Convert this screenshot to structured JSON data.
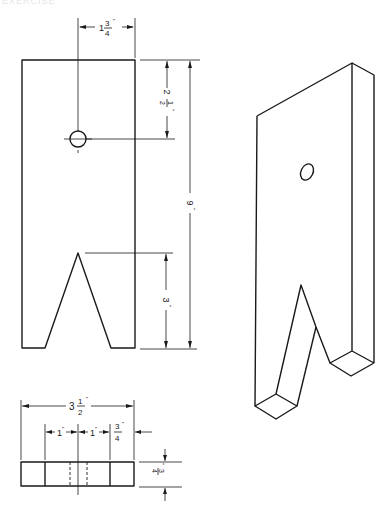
{
  "figure": {
    "header_text": "EXERCISE",
    "views": {
      "front": {
        "label": "front-view",
        "dimensions": {
          "hole_from_top": {
            "whole": "2",
            "num": "1",
            "den": "2",
            "unit": "\""
          },
          "width_to_hole_center": {
            "whole": "1",
            "num": "3",
            "den": "4",
            "unit": "\""
          },
          "overall_height": {
            "text": "9",
            "unit": "\""
          },
          "notch_depth": {
            "text": "3",
            "unit": "\""
          }
        }
      },
      "top": {
        "label": "top-view",
        "dimensions": {
          "overall_width": {
            "whole": "3",
            "num": "1",
            "den": "2",
            "unit": "\""
          },
          "left_segment": {
            "text": "1",
            "unit": "\""
          },
          "middle_segment": {
            "text": "1",
            "unit": "\""
          },
          "right_segment": {
            "num": "3",
            "den": "4",
            "unit": "\""
          },
          "thickness": {
            "num": "3",
            "den": "4",
            "unit": "\""
          }
        }
      },
      "isometric": {
        "label": "isometric-view"
      }
    }
  }
}
